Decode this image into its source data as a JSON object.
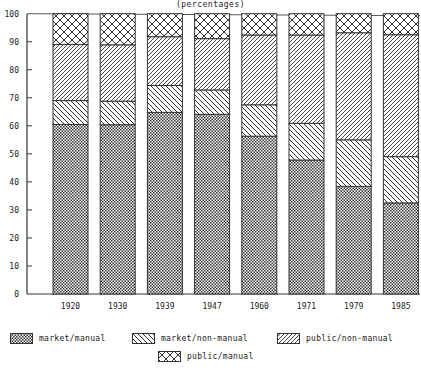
{
  "title": "(percentages)",
  "chart_data": {
    "type": "bar",
    "stacked": true,
    "title": "(percentages)",
    "xlabel": "",
    "ylabel": "",
    "ylim": [
      0,
      100
    ],
    "yticks": [
      0,
      10,
      20,
      30,
      40,
      50,
      60,
      70,
      80,
      90,
      100
    ],
    "grid": false,
    "legend_position": "bottom",
    "categories": [
      "1920",
      "1930",
      "1939",
      "1947",
      "1960",
      "1971",
      "1979",
      "1985"
    ],
    "series": [
      {
        "name": "market/manual",
        "pattern": "fine-crosshatch",
        "values": [
          60.5,
          60.4,
          64.8,
          64.1,
          56.3,
          47.8,
          38.4,
          32.5
        ]
      },
      {
        "name": "market/non-manual",
        "pattern": "backslash-hatch",
        "values": [
          8.5,
          8.4,
          9.6,
          8.7,
          11.2,
          13.1,
          16.6,
          16.5
        ]
      },
      {
        "name": "public/non-manual",
        "pattern": "slash-hatch",
        "values": [
          20.0,
          20.1,
          17.4,
          18.3,
          24.9,
          31.5,
          38.2,
          43.5
        ]
      },
      {
        "name": "public/manual",
        "pattern": "diamond-crosshatch",
        "values": [
          11.0,
          11.1,
          8.2,
          8.9,
          7.6,
          7.6,
          6.8,
          7.5
        ]
      }
    ]
  },
  "legend": {
    "items": [
      {
        "label": "market/manual"
      },
      {
        "label": "market/non-manual"
      },
      {
        "label": "public/non-manual"
      },
      {
        "label": "public/manual"
      }
    ]
  }
}
